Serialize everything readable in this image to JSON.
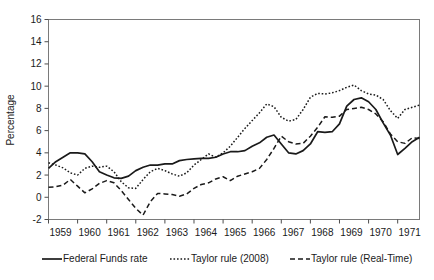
{
  "chart_data": {
    "type": "line",
    "title": "",
    "xlabel": "",
    "ylabel": "Percentage",
    "ylim": [
      -2,
      16
    ],
    "xlim": [
      1959.0,
      1971.75
    ],
    "yticks": [
      -2,
      0,
      2,
      4,
      6,
      8,
      10,
      12,
      14,
      16
    ],
    "ytick_labels": [
      "-2",
      "0",
      "2",
      "4",
      "6",
      "8",
      "10",
      "12",
      "14",
      "16"
    ],
    "xticks": [
      1959,
      1960,
      1961,
      1962,
      1963,
      1964,
      1965,
      1966,
      1967,
      1968,
      1969,
      1970,
      1971
    ],
    "xtick_labels": [
      "1959",
      "1960",
      "1961",
      "1962",
      "1963",
      "1964",
      "1965",
      "1966",
      "1967",
      "1968",
      "1969",
      "1970",
      "1971"
    ],
    "grid": false,
    "legend_position": "bottom",
    "x": [
      1959.0,
      1959.25,
      1959.5,
      1959.75,
      1960.0,
      1960.25,
      1960.5,
      1960.75,
      1961.0,
      1961.25,
      1961.5,
      1961.75,
      1962.0,
      1962.25,
      1962.5,
      1962.75,
      1963.0,
      1963.25,
      1963.5,
      1963.75,
      1964.0,
      1964.25,
      1964.5,
      1964.75,
      1965.0,
      1965.25,
      1965.5,
      1965.75,
      1966.0,
      1966.25,
      1966.5,
      1966.75,
      1967.0,
      1967.25,
      1967.5,
      1967.75,
      1968.0,
      1968.25,
      1968.5,
      1968.75,
      1969.0,
      1969.25,
      1969.5,
      1969.75,
      1970.0,
      1970.25,
      1970.5,
      1970.75,
      1971.0,
      1971.25,
      1971.5,
      1971.75
    ],
    "series": [
      {
        "name": "Federal Funds rate",
        "style": "solid",
        "color": "#1a1a1a",
        "values": [
          2.6,
          3.2,
          3.6,
          4.0,
          4.0,
          3.9,
          3.2,
          2.3,
          2.0,
          1.75,
          1.7,
          1.9,
          2.4,
          2.7,
          2.9,
          2.9,
          3.0,
          3.0,
          3.3,
          3.4,
          3.45,
          3.5,
          3.5,
          3.6,
          3.9,
          4.1,
          4.1,
          4.2,
          4.6,
          4.9,
          5.4,
          5.6,
          4.8,
          4.0,
          3.9,
          4.2,
          4.8,
          5.9,
          5.85,
          5.9,
          6.6,
          8.2,
          8.8,
          8.95,
          8.6,
          7.9,
          6.7,
          5.6,
          3.85,
          4.4,
          5.0,
          5.4
        ]
      },
      {
        "name": "Taylor rule (2008)",
        "style": "dotted",
        "color": "#1a1a1a",
        "values": [
          3.1,
          2.9,
          2.65,
          2.2,
          2.0,
          2.6,
          2.8,
          2.7,
          2.8,
          2.3,
          1.4,
          0.85,
          0.8,
          1.6,
          2.3,
          2.6,
          2.4,
          2.1,
          1.9,
          2.2,
          2.9,
          3.4,
          3.9,
          3.6,
          4.0,
          4.6,
          5.4,
          6.2,
          6.9,
          7.6,
          8.4,
          8.15,
          7.2,
          6.85,
          7.0,
          7.9,
          9.0,
          9.35,
          9.3,
          9.4,
          9.6,
          9.9,
          10.1,
          9.6,
          9.3,
          9.2,
          8.8,
          7.8,
          7.1,
          7.9,
          8.1,
          8.3
        ]
      },
      {
        "name": "Taylor rule (Real-Time)",
        "style": "dashed",
        "color": "#1a1a1a",
        "values": [
          0.9,
          0.95,
          1.1,
          1.6,
          1.0,
          0.4,
          0.75,
          1.25,
          1.5,
          1.3,
          0.6,
          -0.2,
          -1.0,
          -1.6,
          -0.4,
          0.35,
          0.3,
          0.25,
          0.1,
          0.3,
          0.8,
          1.15,
          1.3,
          1.65,
          1.85,
          1.5,
          1.9,
          2.1,
          2.3,
          2.6,
          3.4,
          4.4,
          5.5,
          5.0,
          4.8,
          4.85,
          5.5,
          6.3,
          7.25,
          7.2,
          7.3,
          7.9,
          8.0,
          8.1,
          7.9,
          7.5,
          6.8,
          5.7,
          5.0,
          4.85,
          5.35,
          5.3
        ]
      }
    ]
  },
  "legend": {
    "items": [
      {
        "label": "Federal Funds rate",
        "style": "solid"
      },
      {
        "label": "Taylor rule (2008)",
        "style": "dotted"
      },
      {
        "label": "Taylor rule (Real-Time)",
        "style": "dashed"
      }
    ]
  },
  "axes": {
    "y_title": "Percentage"
  }
}
